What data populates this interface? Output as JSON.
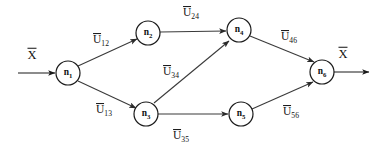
{
  "diagram": {
    "colors": {
      "node_stroke": "#1a1a1a",
      "edge_stroke": "#3a3a3a",
      "text": "#111111",
      "background": "#ffffff"
    },
    "input": {
      "label_base": "X",
      "label": "X̄",
      "x": 32,
      "y": 55,
      "arrow_from_x": 18,
      "arrow_to_x": 55,
      "arrow_y": 73
    },
    "output": {
      "label_base": "X",
      "label": "X̄",
      "x": 343,
      "y": 54,
      "arrow_from_x": 334,
      "arrow_to_x": 369,
      "arrow_y": 72
    },
    "nodes": [
      {
        "id": "n1",
        "base": "n",
        "sub": "1",
        "cx": 68,
        "cy": 73,
        "r": 12
      },
      {
        "id": "n2",
        "base": "n",
        "sub": "2",
        "cx": 148,
        "cy": 33,
        "r": 12
      },
      {
        "id": "n3",
        "base": "n",
        "sub": "3",
        "cx": 146,
        "cy": 114,
        "r": 12
      },
      {
        "id": "n4",
        "base": "n",
        "sub": "4",
        "cx": 239,
        "cy": 30,
        "r": 12
      },
      {
        "id": "n5",
        "base": "n",
        "sub": "5",
        "cx": 241,
        "cy": 114,
        "r": 12
      },
      {
        "id": "n6",
        "base": "n",
        "sub": "6",
        "cx": 322,
        "cy": 72,
        "r": 12
      }
    ],
    "edges": [
      {
        "id": "e12",
        "from": "n1",
        "to": "n2",
        "base": "U",
        "sub": "12",
        "label": "Ū₁₂",
        "label_x": 101,
        "label_y": 41,
        "x1": 78,
        "y1": 66,
        "x2": 137,
        "y2": 39
      },
      {
        "id": "e13",
        "from": "n1",
        "to": "n3",
        "base": "U",
        "sub": "13",
        "label": "Ū₁₃",
        "label_x": 104,
        "label_y": 111,
        "x1": 78,
        "y1": 81,
        "x2": 136,
        "y2": 108
      },
      {
        "id": "e24",
        "from": "n2",
        "to": "n4",
        "base": "U",
        "sub": "24",
        "label": "Ū₂₄",
        "label_x": 191,
        "label_y": 14,
        "x1": 160,
        "y1": 32,
        "x2": 226,
        "y2": 31
      },
      {
        "id": "e34",
        "from": "n3",
        "to": "n4",
        "base": "U",
        "sub": "34",
        "label": "Ū₃₄",
        "label_x": 171,
        "label_y": 73,
        "x1": 154,
        "y1": 103,
        "x2": 229,
        "y2": 41
      },
      {
        "id": "e35",
        "from": "n3",
        "to": "n5",
        "base": "U",
        "sub": "35",
        "label": "Ū₃₅",
        "label_x": 181,
        "label_y": 137,
        "x1": 158,
        "y1": 114,
        "x2": 228,
        "y2": 114
      },
      {
        "id": "e46",
        "from": "n4",
        "to": "n6",
        "base": "U",
        "sub": "46",
        "label": "Ū₄₆",
        "label_x": 289,
        "label_y": 38,
        "x1": 250,
        "y1": 36,
        "x2": 314,
        "y2": 62
      },
      {
        "id": "e56",
        "from": "n5",
        "to": "n6",
        "base": "U",
        "sub": "56",
        "label": "Ū₅₆",
        "label_x": 291,
        "label_y": 113,
        "x1": 252,
        "y1": 109,
        "x2": 313,
        "y2": 82
      }
    ]
  }
}
